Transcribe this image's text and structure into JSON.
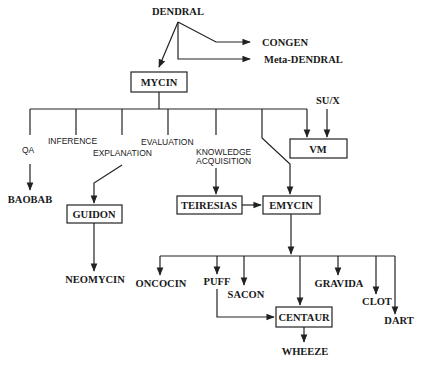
{
  "diagram": {
    "nodes": {
      "dendral": {
        "label": "DENDRAL",
        "boxed": false
      },
      "congen": {
        "label": "CONGEN",
        "boxed": false
      },
      "meta_dendral": {
        "label": "Meta-DENDRAL",
        "boxed": false
      },
      "mycin": {
        "label": "MYCIN",
        "boxed": true
      },
      "sux": {
        "label": "SU/X",
        "boxed": false
      },
      "vm": {
        "label": "VM",
        "boxed": true
      },
      "baobab": {
        "label": "BAOBAB",
        "boxed": false
      },
      "guidon": {
        "label": "GUIDON",
        "boxed": true
      },
      "neomycin": {
        "label": "NEOMYCIN",
        "boxed": false
      },
      "teiresias": {
        "label": "TEIRESIAS",
        "boxed": true
      },
      "emycin": {
        "label": "EMYCIN",
        "boxed": true
      },
      "oncocin": {
        "label": "ONCOCIN",
        "boxed": false
      },
      "puff": {
        "label": "PUFF",
        "boxed": false
      },
      "sacon": {
        "label": "SACON",
        "boxed": false
      },
      "centaur": {
        "label": "CENTAUR",
        "boxed": true
      },
      "gravida": {
        "label": "GRAVIDA",
        "boxed": false
      },
      "clot": {
        "label": "CLOT",
        "boxed": false
      },
      "dart": {
        "label": "DART",
        "boxed": false
      },
      "wheeze": {
        "label": "WHEEZE",
        "boxed": false
      }
    },
    "branch_labels": {
      "qa": "QA",
      "inference": "INFERENCE",
      "explanation": "EXPLANATION",
      "evaluation": "EVALUATION",
      "knowledge_1": "KNOWLEDGE",
      "knowledge_2": "ACQUISITION"
    },
    "edges": [
      [
        "DENDRAL",
        "MYCIN"
      ],
      [
        "DENDRAL",
        "CONGEN"
      ],
      [
        "DENDRAL",
        "Meta-DENDRAL"
      ],
      [
        "MYCIN",
        "BAOBAB"
      ],
      [
        "MYCIN",
        "GUIDON"
      ],
      [
        "MYCIN",
        "TEIRESIAS"
      ],
      [
        "MYCIN",
        "EMYCIN"
      ],
      [
        "MYCIN",
        "VM"
      ],
      [
        "SU/X",
        "VM"
      ],
      [
        "GUIDON",
        "NEOMYCIN"
      ],
      [
        "TEIRESIAS",
        "EMYCIN"
      ],
      [
        "EMYCIN",
        "ONCOCIN"
      ],
      [
        "EMYCIN",
        "PUFF"
      ],
      [
        "EMYCIN",
        "SACON"
      ],
      [
        "EMYCIN",
        "CENTAUR"
      ],
      [
        "EMYCIN",
        "GRAVIDA"
      ],
      [
        "EMYCIN",
        "CLOT"
      ],
      [
        "EMYCIN",
        "DART"
      ],
      [
        "PUFF",
        "CENTAUR"
      ],
      [
        "CENTAUR",
        "WHEEZE"
      ]
    ]
  }
}
